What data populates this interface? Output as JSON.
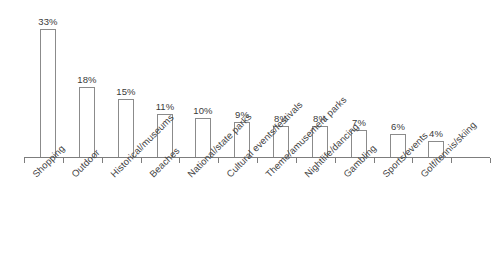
{
  "chart_data": {
    "type": "bar",
    "title": "",
    "subtitle": "",
    "xlabel": "",
    "ylabel": "",
    "grid": false,
    "legend": "none",
    "ylim": [
      0,
      35
    ],
    "value_suffix": "%",
    "categories": [
      "Shopping",
      "Outdoor",
      "Historical/museums",
      "Beaches",
      "National/state parks",
      "Cultural events/festivals",
      "Theme/amusement parks",
      "Nightlife/dancing",
      "Gambling",
      "Sports/events",
      "Golf/tennis/skiing"
    ],
    "values": [
      33,
      18,
      15,
      11,
      10,
      9,
      8,
      8,
      7,
      6,
      4
    ],
    "value_labels": [
      "33%",
      "18%",
      "15%",
      "11%",
      "10%",
      "9%",
      "8%",
      "8%",
      "7%",
      "6%",
      "4%"
    ],
    "colors": {
      "bar_fill": "#ffffff",
      "bar_stroke": "#8b8b8b",
      "axis": "#7d7d7d",
      "text": "#454545",
      "value_text": "#3a3a3a",
      "background": "#ffffff"
    }
  }
}
